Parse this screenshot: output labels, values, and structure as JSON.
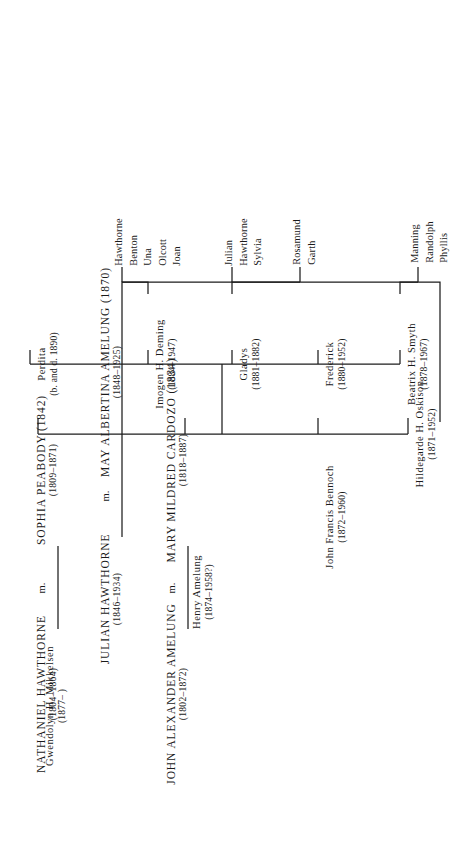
{
  "document": {
    "kind": "genealogical-chart",
    "family": "Hawthorne"
  },
  "generation1": {
    "couple_a": {
      "left": {
        "name": "NATHANIEL HAWTHORNE",
        "dates": "(1804–1864)"
      },
      "marriage_mark": "m.",
      "right": {
        "name": "SOPHIA PEABODY (1842)",
        "dates": "(1809–1871)"
      }
    },
    "couple_b": {
      "left": {
        "name": "JOHN ALEXANDER AMELUNG",
        "dates": "(1802–1872)"
      },
      "marriage_mark": "m.",
      "right": {
        "name": "MARY MILDRED CARDOZO (1834)",
        "dates": "(1818–1887)"
      }
    }
  },
  "generation2": {
    "left": {
      "name": "JULIAN HAWTHORNE",
      "dates": "(1846–1934)"
    },
    "marriage_mark": "m.",
    "right": {
      "name": "MAY ALBERTINA AMELUNG (1870)",
      "dates": "(1848–1925)"
    }
  },
  "generation3": [
    {
      "name": "Hildegarde H. Oskison",
      "dates": "(1871–1952)"
    },
    {
      "name": "John Francis Bennoch",
      "dates": "(1872–1960)"
    },
    {
      "name": "Henry Amelung",
      "dates": "(1874–1958?)"
    },
    {
      "name": "Gwendolyn H. Mikkelsen",
      "dates": "(1877–      )"
    }
  ],
  "generation3b": [
    {
      "name": "Beatrix H. Smyth",
      "dates": "(1878–1967)"
    },
    {
      "name": "Frederick",
      "dates": "(1880–1952)"
    },
    {
      "name": "Gladys",
      "dates": "(1881–1882)"
    },
    {
      "name": "Imogen H. Deming",
      "dates": "(1884–1947)"
    },
    {
      "name": "Perdita",
      "dates": "(b. and d. 1890)"
    }
  ],
  "generation4": [
    {
      "group": "group-manning",
      "children": [
        "Manning",
        "Randolph",
        "Phyllis"
      ]
    },
    {
      "group": "group-rosamund",
      "children": [
        "Rosamund",
        "Garth"
      ]
    },
    {
      "group": "group-julian",
      "children": [
        "Julian",
        "Hawthorne",
        "Sylvia"
      ]
    },
    {
      "group": "group-hawthorne",
      "children": [
        "Hawthorne",
        "Benton",
        "Una",
        "Olcott",
        "Joan"
      ]
    }
  ],
  "colors": {
    "ink": "#1a1a1a",
    "rule": "#1d1d1d",
    "paper": "#ffffff"
  }
}
